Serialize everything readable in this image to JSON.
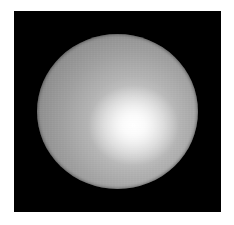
{
  "image": {
    "description": "Rendered shaded sphere on black background",
    "subject": "sphere",
    "colors": {
      "page_background": "#ffffff",
      "frame_background": "#000000",
      "sphere_edge": "#6a6a6a",
      "sphere_mid": "#a0a0a0",
      "highlight": "#ffffff"
    },
    "geometry": {
      "frame": {
        "x": 14,
        "y": 11,
        "width": 207,
        "height": 201
      },
      "sphere": {
        "x": 37,
        "y": 34,
        "width": 161,
        "height": 155
      },
      "highlight_center": {
        "x": 133,
        "y": 126
      }
    }
  }
}
